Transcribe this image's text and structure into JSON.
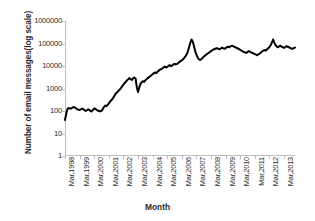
{
  "chart_data": {
    "type": "line",
    "title": "",
    "xlabel": "Month",
    "ylabel": "Number of email messages(log scale)",
    "yscale": "log",
    "ylim": [
      1,
      1000000
    ],
    "ytick_labels": [
      "1000000",
      "100000",
      "10000",
      "1000",
      "100",
      "10",
      "1"
    ],
    "ytick_values": [
      1000000,
      100000,
      10000,
      1000,
      100,
      10,
      1
    ],
    "xtick_labels": [
      "Mar,1998",
      "Mar,1999",
      "Mar,2000",
      "Mar,2001",
      "Mar,2002",
      "Mar,2003",
      "Mar,2004",
      "Mar,2005",
      "Mar,2006",
      "Mar,2007",
      "Mar,2008",
      "Mar,2009",
      "Mar,2010",
      "Mar,2011",
      "Mar,2012",
      "Mar,2013"
    ],
    "grid": false,
    "legend": false,
    "line_color": "#000000",
    "line_width": 2.0,
    "series": [
      {
        "name": "Number of email messages",
        "x": [
          "Mar,1998",
          "Apr,1998",
          "May,1998",
          "Jun,1998",
          "Jul,1998",
          "Aug,1998",
          "Sep,1998",
          "Oct,1998",
          "Nov,1998",
          "Dec,1998",
          "Jan,1999",
          "Feb,1999",
          "Mar,1999",
          "Apr,1999",
          "May,1999",
          "Jun,1999",
          "Jul,1999",
          "Aug,1999",
          "Sep,1999",
          "Oct,1999",
          "Nov,1999",
          "Dec,1999",
          "Jan,2000",
          "Feb,2000",
          "Mar,2000",
          "Apr,2000",
          "May,2000",
          "Jun,2000",
          "Jul,2000",
          "Aug,2000",
          "Sep,2000",
          "Oct,2000",
          "Nov,2000",
          "Dec,2000",
          "Jan,2001",
          "Feb,2001",
          "Mar,2001",
          "Apr,2001",
          "May,2001",
          "Jun,2001",
          "Jul,2001",
          "Aug,2001",
          "Sep,2001",
          "Oct,2001",
          "Nov,2001",
          "Dec,2001",
          "Jan,2002",
          "Feb,2002",
          "Mar,2002",
          "Apr,2002",
          "May,2002",
          "Jun,2002",
          "Jul,2002",
          "Aug,2002",
          "Sep,2002",
          "Oct,2002",
          "Nov,2002",
          "Dec,2002",
          "Jan,2003",
          "Feb,2003",
          "Mar,2003",
          "Apr,2003",
          "May,2003",
          "Jun,2003",
          "Jul,2003",
          "Aug,2003",
          "Sep,2003",
          "Oct,2003",
          "Nov,2003",
          "Dec,2003",
          "Jan,2004",
          "Feb,2004",
          "Mar,2004",
          "Apr,2004",
          "May,2004",
          "Jun,2004",
          "Jul,2004",
          "Aug,2004",
          "Sep,2004",
          "Oct,2004",
          "Nov,2004",
          "Dec,2004",
          "Jan,2005",
          "Feb,2005",
          "Mar,2005",
          "Apr,2005",
          "May,2005",
          "Jun,2005",
          "Jul,2005",
          "Aug,2005",
          "Sep,2005",
          "Oct,2005",
          "Nov,2005",
          "Dec,2005",
          "Jan,2006",
          "Feb,2006",
          "Mar,2006",
          "Apr,2006",
          "May,2006",
          "Jun,2006",
          "Jul,2006",
          "Aug,2006",
          "Sep,2006",
          "Oct,2006",
          "Nov,2006",
          "Dec,2006",
          "Jan,2007",
          "Feb,2007",
          "Mar,2007",
          "Apr,2007",
          "May,2007",
          "Jun,2007",
          "Jul,2007",
          "Aug,2007",
          "Sep,2007",
          "Oct,2007",
          "Nov,2007",
          "Dec,2007",
          "Jan,2008",
          "Feb,2008",
          "Mar,2008",
          "Apr,2008",
          "May,2008",
          "Jun,2008",
          "Jul,2008",
          "Aug,2008",
          "Sep,2008",
          "Oct,2008",
          "Nov,2008",
          "Dec,2008",
          "Jan,2009",
          "Feb,2009",
          "Mar,2009",
          "Apr,2009",
          "May,2009",
          "Jun,2009",
          "Jul,2009",
          "Aug,2009",
          "Sep,2009",
          "Oct,2009",
          "Nov,2009",
          "Dec,2009",
          "Jan,2010",
          "Feb,2010",
          "Mar,2010",
          "Apr,2010",
          "May,2010",
          "Jun,2010",
          "Jul,2010",
          "Aug,2010",
          "Sep,2010",
          "Oct,2010",
          "Nov,2010",
          "Dec,2010",
          "Jan,2011",
          "Feb,2011",
          "Mar,2011",
          "Apr,2011",
          "May,2011",
          "Jun,2011",
          "Jul,2011",
          "Aug,2011",
          "Sep,2011",
          "Oct,2011",
          "Nov,2011",
          "Dec,2011",
          "Jan,2012",
          "Feb,2012",
          "Mar,2012",
          "Apr,2012",
          "May,2012",
          "Jun,2012",
          "Jul,2012",
          "Aug,2012",
          "Sep,2012",
          "Oct,2012",
          "Nov,2012",
          "Dec,2012",
          "Jan,2013",
          "Feb,2013",
          "Mar,2013",
          "Apr,2013",
          "May,2013",
          "Jun,2013",
          "Jul,2013",
          "Aug,2013",
          "Sep,2013",
          "Oct,2013",
          "Nov,2013",
          "Dec,2013"
        ],
        "values": [
          40,
          75,
          120,
          135,
          130,
          128,
          140,
          150,
          145,
          132,
          120,
          115,
          110,
          118,
          128,
          122,
          108,
          100,
          108,
          118,
          112,
          100,
          95,
          112,
          130,
          125,
          112,
          105,
          100,
          96,
          102,
          120,
          150,
          175,
          165,
          185,
          220,
          260,
          300,
          340,
          420,
          520,
          620,
          700,
          800,
          900,
          1050,
          1250,
          1500,
          1750,
          2000,
          2300,
          2600,
          2900,
          2550,
          2400,
          2900,
          3100,
          2800,
          1150,
          700,
          1100,
          1600,
          1900,
          2100,
          2000,
          2300,
          2600,
          2900,
          3200,
          3500,
          3900,
          4300,
          4800,
          5200,
          4800,
          5500,
          6200,
          6800,
          7200,
          7800,
          8600,
          9500,
          8500,
          9200,
          10000,
          11000,
          9800,
          10500,
          11500,
          12500,
          11800,
          12500,
          13500,
          15000,
          16500,
          18000,
          20000,
          23000,
          27000,
          33000,
          45000,
          70000,
          110000,
          150000,
          120000,
          75000,
          45000,
          32000,
          24000,
          20000,
          18500,
          20000,
          23000,
          26000,
          29000,
          32000,
          35000,
          38000,
          42000,
          46000,
          50000,
          54000,
          57000,
          60000,
          62000,
          58000,
          55000,
          60000,
          65000,
          62000,
          58000,
          62000,
          68000,
          72000,
          68000,
          75000,
          80000,
          76000,
          72000,
          68000,
          64000,
          60000,
          56000,
          52000,
          48000,
          45000,
          42000,
          40000,
          38000,
          42000,
          46000,
          43000,
          40000,
          38000,
          36000,
          34000,
          32000,
          30000,
          33000,
          36000,
          40000,
          44000,
          48000,
          52000,
          48000,
          55000,
          62000,
          70000,
          85000,
          110000,
          150000,
          110000,
          85000,
          72000,
          68000,
          75000,
          80000,
          72000,
          68000,
          64000,
          70000,
          76000,
          72000,
          68000,
          64000,
          60000,
          58000,
          62000,
          66000
        ]
      }
    ]
  }
}
